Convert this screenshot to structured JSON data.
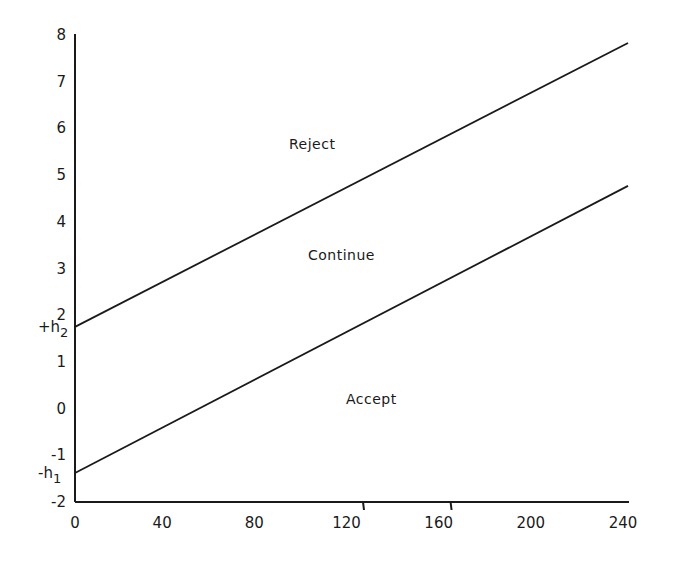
{
  "chart_data": {
    "type": "line",
    "title": "",
    "xlabel": "",
    "ylabel": "",
    "xlim": [
      0,
      240
    ],
    "ylim": [
      -2,
      8
    ],
    "grid": false,
    "legend": null,
    "x_ticks": [
      0,
      40,
      80,
      120,
      160,
      200,
      240
    ],
    "x_tick_labels": [
      "0",
      "40",
      "80",
      "120",
      "160",
      "200",
      "240"
    ],
    "y_ticks": [
      8,
      7,
      6,
      5,
      4,
      3,
      2,
      1,
      0,
      -1,
      -2
    ],
    "y_tick_labels": [
      "8",
      "7",
      "6",
      "5",
      "4",
      "3",
      "2",
      "1",
      "0",
      "-1",
      "-2"
    ],
    "series": [
      {
        "name": "Upper boundary (reject line)",
        "x": [
          0,
          240
        ],
        "values": [
          1.75,
          7.83
        ],
        "intercept_label": "+h2"
      },
      {
        "name": "Lower boundary (accept line)",
        "x": [
          0,
          240
        ],
        "values": [
          -1.38,
          4.77
        ],
        "intercept_label": "-h1"
      }
    ],
    "annotations": [
      {
        "text": "Reject",
        "x": 95,
        "y": 6.0
      },
      {
        "text": "Continue",
        "x": 100,
        "y": 3.2
      },
      {
        "text": "Accept",
        "x": 122,
        "y": 0.1
      },
      {
        "text": "+h2",
        "x": 0,
        "y": 1.75,
        "position": "y-axis"
      },
      {
        "text": "-h1",
        "x": 0,
        "y": -1.38,
        "position": "y-axis"
      }
    ]
  },
  "labels": {
    "reject": "Reject",
    "continue": "Continue",
    "accept": "Accept",
    "h2_prefix": "+h",
    "h2_sub": "2",
    "h1_prefix": "-h",
    "h1_sub": "1"
  }
}
